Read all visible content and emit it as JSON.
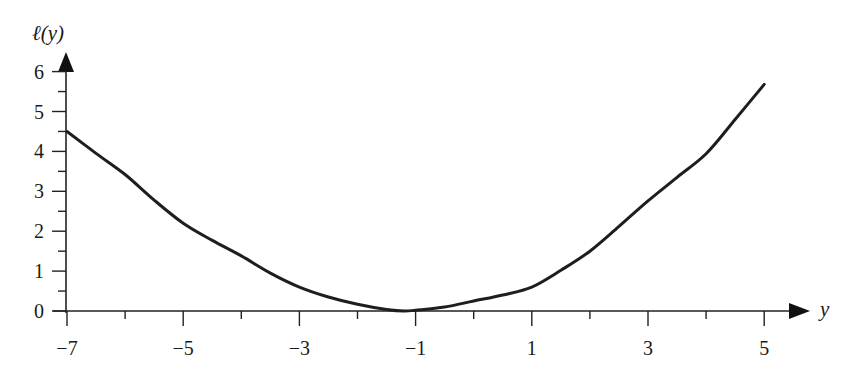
{
  "chart_data": {
    "type": "line",
    "title": "",
    "xlabel": "y",
    "ylabel": "ℓ(y)",
    "xlim": [
      -7,
      5
    ],
    "ylim": [
      0,
      6
    ],
    "grid": false,
    "legend": null,
    "x_ticks": [
      -7,
      -5,
      -3,
      -1,
      1,
      3,
      5
    ],
    "x_tick_labels": [
      "−7",
      "−5",
      "−3",
      "−1",
      "1",
      "3",
      "5"
    ],
    "x_minor_ticks": [
      -6,
      -4,
      -2,
      0,
      2,
      4
    ],
    "y_ticks": [
      0,
      1,
      2,
      3,
      4,
      5,
      6
    ],
    "y_tick_labels": [
      "0",
      "1",
      "2",
      "3",
      "4",
      "5",
      "6"
    ],
    "y_minor_ticks": [
      0.5,
      1.5,
      2.5,
      3.5,
      4.5,
      5.5
    ],
    "series": [
      {
        "name": "ℓ(y)",
        "x": [
          -7,
          -6.5,
          -6,
          -5.5,
          -5,
          -4.5,
          -4,
          -3.5,
          -3,
          -2.5,
          -2,
          -1.5,
          -1.2,
          -1,
          -0.5,
          0,
          0.5,
          1,
          1.5,
          2,
          2.5,
          3,
          3.5,
          4,
          4.5,
          5
        ],
        "values": [
          4.5,
          3.95,
          3.42,
          2.78,
          2.2,
          1.77,
          1.38,
          0.95,
          0.6,
          0.35,
          0.17,
          0.04,
          0.0,
          0.02,
          0.1,
          0.25,
          0.4,
          0.6,
          1.02,
          1.5,
          2.12,
          2.76,
          3.35,
          3.94,
          4.8,
          5.68
        ]
      }
    ]
  },
  "labels": {
    "y_axis_title": "ℓ(y)",
    "x_axis_title": "y"
  }
}
